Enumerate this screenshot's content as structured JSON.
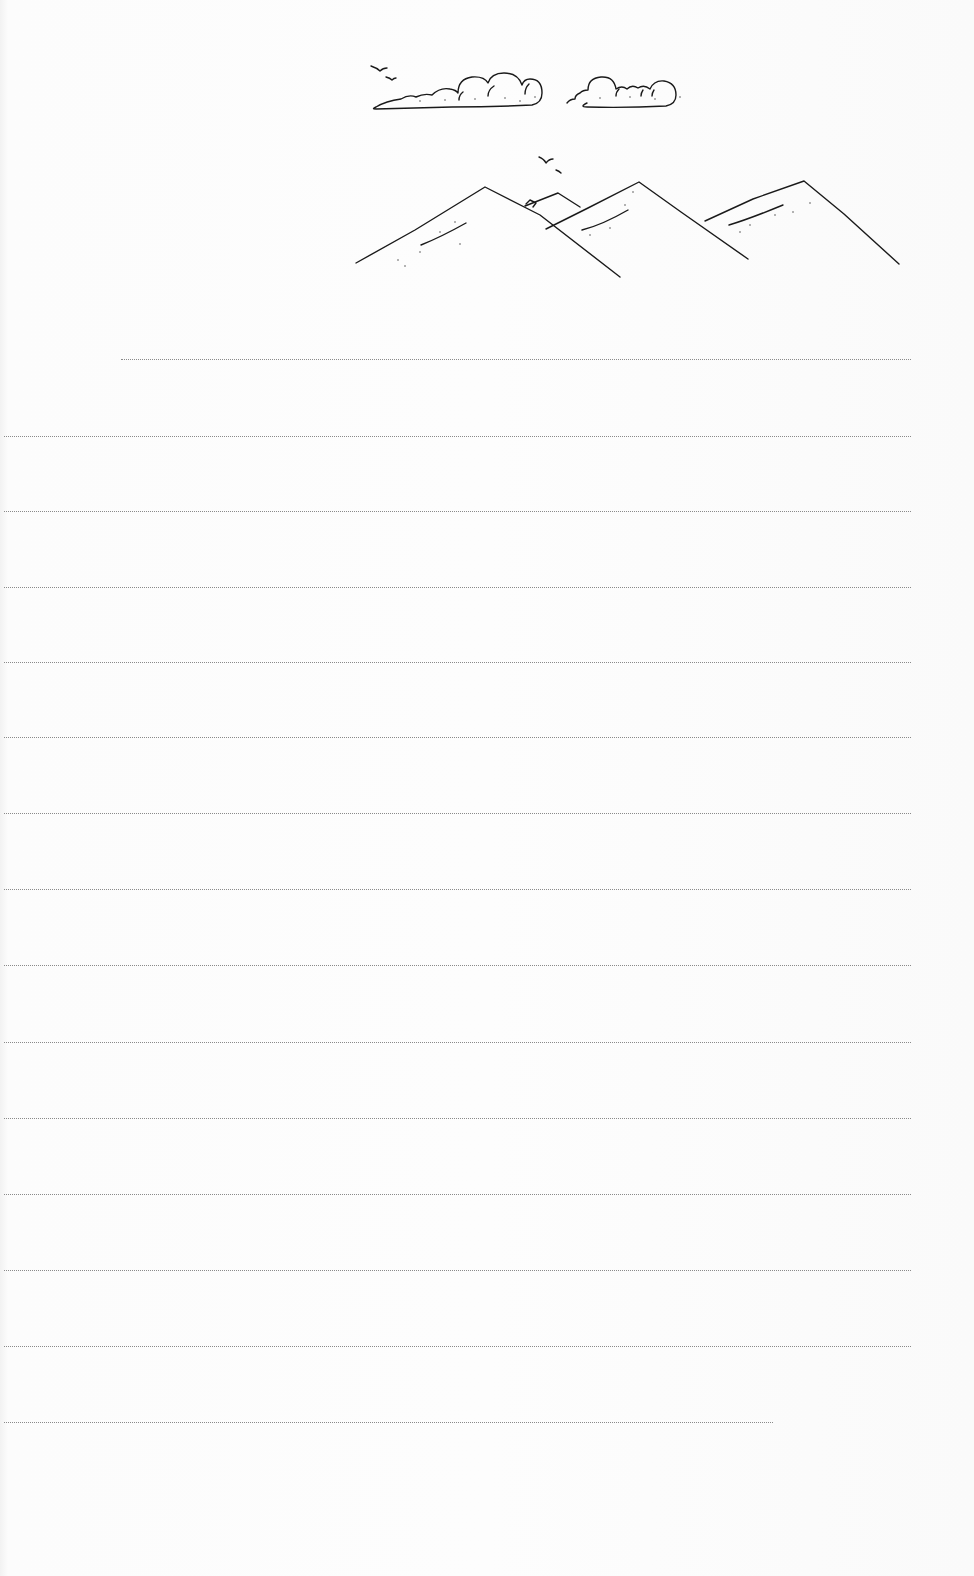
{
  "document": {
    "type": "lined stationery page",
    "illustration": {
      "name": "mountains-clouds-birds",
      "elements": [
        "bird",
        "bird",
        "cloud",
        "cloud",
        "bird",
        "bird",
        "mountain",
        "mountain",
        "mountain",
        "mountain"
      ]
    },
    "ruled_lines": [
      {
        "y": 359,
        "x1": 121,
        "x2": 911
      },
      {
        "y": 436,
        "x1": 4,
        "x2": 911
      },
      {
        "y": 511,
        "x1": 4,
        "x2": 911
      },
      {
        "y": 587,
        "x1": 4,
        "x2": 911
      },
      {
        "y": 662,
        "x1": 4,
        "x2": 911
      },
      {
        "y": 737,
        "x1": 4,
        "x2": 911
      },
      {
        "y": 813,
        "x1": 4,
        "x2": 911
      },
      {
        "y": 889,
        "x1": 4,
        "x2": 911
      },
      {
        "y": 965,
        "x1": 4,
        "x2": 911
      },
      {
        "y": 1042,
        "x1": 4,
        "x2": 911
      },
      {
        "y": 1118,
        "x1": 4,
        "x2": 911
      },
      {
        "y": 1194,
        "x1": 4,
        "x2": 911
      },
      {
        "y": 1270,
        "x1": 4,
        "x2": 911
      },
      {
        "y": 1346,
        "x1": 4,
        "x2": 911
      },
      {
        "y": 1422,
        "x1": 4,
        "x2": 773
      }
    ],
    "colors": {
      "paper": "#fbfbfb",
      "ink": "#1a1a1a",
      "rule": "#8a8a8a"
    }
  }
}
